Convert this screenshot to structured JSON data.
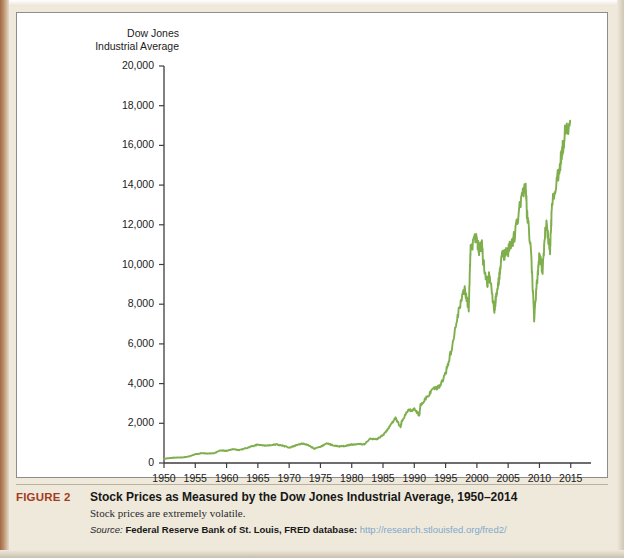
{
  "figure": {
    "label": "FIGURE 2",
    "title": "Stock Prices as Measured by the Dow Jones Industrial Average, 1950–2014",
    "subtitle": "Stock prices are extremely volatile.",
    "source_word": "Source:",
    "source_name": "Federal Reserve Bank of St. Louis, FRED database:",
    "source_url": "http://research.stlouisfed.org/fred2/"
  },
  "colors": {
    "line": "#7fae4c",
    "axis": "#3d3d3d",
    "figure_label": "#a33b23",
    "page_background": "#efe9dc",
    "panel_background": "#ffffff",
    "url_link": "#7fa8c9"
  },
  "chart_data": {
    "type": "line",
    "title": "Stock Prices as Measured by the Dow Jones Industrial Average, 1950–2014",
    "xlabel": "",
    "ylabel": "Dow Jones\nIndustrial Average",
    "xlim": [
      1950,
      2016
    ],
    "ylim": [
      0,
      20000
    ],
    "grid": false,
    "legend": "none",
    "yticks": [
      0,
      2000,
      4000,
      6000,
      8000,
      10000,
      12000,
      14000,
      16000,
      18000,
      20000
    ],
    "ytick_labels": [
      "0",
      "2,000",
      "4,000",
      "6,000",
      "8,000",
      "10,000",
      "12,000",
      "14,000",
      "16,000",
      "18,000",
      "20,000"
    ],
    "xticks": [
      1950,
      1955,
      1960,
      1965,
      1970,
      1975,
      1980,
      1985,
      1990,
      1995,
      2000,
      2005,
      2010,
      2015
    ],
    "xtick_labels": [
      "1950",
      "1955",
      "1960",
      "1965",
      "1970",
      "1975",
      "1980",
      "1985",
      "1990",
      "1995",
      "2000",
      "2005",
      "2010",
      "2015"
    ],
    "series": [
      {
        "name": "Dow Jones Industrial Average",
        "color": "#7fae4c",
        "x": [
          1950,
          1951,
          1952,
          1953,
          1954,
          1955,
          1956,
          1957,
          1958,
          1959,
          1960,
          1961,
          1962,
          1963,
          1964,
          1965,
          1966,
          1967,
          1968,
          1969,
          1970,
          1971,
          1972,
          1973,
          1974,
          1975,
          1976,
          1977,
          1978,
          1979,
          1980,
          1981,
          1982,
          1983,
          1984,
          1985,
          1986,
          1987,
          1987.8,
          1988,
          1989,
          1990,
          1990.8,
          1991,
          1992,
          1993,
          1994,
          1995,
          1996,
          1997,
          1998,
          1998.7,
          1999,
          1999.9,
          2000.3,
          2000.8,
          2001,
          2001.7,
          2002,
          2002.8,
          2003,
          2003.5,
          2004,
          2005,
          2006,
          2007,
          2007.8,
          2008,
          2008.6,
          2009.15,
          2009.7,
          2010,
          2010.5,
          2011,
          2011.7,
          2012,
          2013,
          2013.5,
          2014,
          2014.9
        ],
        "values": [
          216,
          250,
          275,
          281,
          330,
          442,
          493,
          476,
          492,
          631,
          617,
          692,
          646,
          735,
          835,
          925,
          870,
          895,
          930,
          876,
          760,
          880,
          980,
          920,
          720,
          820,
          975,
          900,
          830,
          860,
          930,
          950,
          940,
          1230,
          1200,
          1400,
          1800,
          2250,
          1800,
          2100,
          2650,
          2700,
          2400,
          2950,
          3300,
          3700,
          3830,
          4500,
          5800,
          7500,
          8800,
          7800,
          10800,
          11500,
          10700,
          11000,
          10200,
          9000,
          9500,
          7700,
          8200,
          9200,
          10400,
          10700,
          11400,
          13200,
          14000,
          12500,
          11000,
          7200,
          9500,
          10500,
          9700,
          12200,
          10700,
          13000,
          14500,
          15400,
          16500,
          17250
        ]
      }
    ],
    "notable_points": [
      {
        "year": 1950,
        "value": 216,
        "note": "start of series"
      },
      {
        "year": 1966,
        "value": 870,
        "note": "1960s local peak"
      },
      {
        "year": 1974,
        "value": 720,
        "note": "1973–74 bear market trough"
      },
      {
        "year": 1987,
        "value": 2250,
        "note": "peak before October 1987 crash"
      },
      {
        "year": 2000,
        "value": 11500,
        "note": "dot-com peak"
      },
      {
        "year": 2003,
        "value": 7700,
        "note": "post dot-com trough"
      },
      {
        "year": 2007,
        "value": 14000,
        "note": "pre-financial-crisis peak"
      },
      {
        "year": 2009,
        "value": 7200,
        "note": "financial crisis trough"
      },
      {
        "year": 2014,
        "value": 17250,
        "note": "end of series"
      }
    ]
  }
}
